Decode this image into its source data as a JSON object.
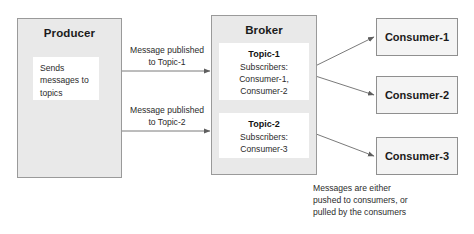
{
  "diagram": {
    "producer": {
      "title": "Producer",
      "note_lines": [
        "Sends",
        "messages to",
        "topics"
      ]
    },
    "broker": {
      "title": "Broker",
      "topics": [
        {
          "name": "Topic-1",
          "subscribers_label": "Subscribers:",
          "subscribers": [
            "Consumer-1,",
            "Consumer-2"
          ]
        },
        {
          "name": "Topic-2",
          "subscribers_label": "Subscribers:",
          "subscribers": [
            "Consumer-3"
          ]
        }
      ]
    },
    "consumers": [
      {
        "label": "Consumer-1"
      },
      {
        "label": "Consumer-2"
      },
      {
        "label": "Consumer-3"
      }
    ],
    "edge_labels": [
      {
        "line1": "Message published",
        "line2": "to Topic-1"
      },
      {
        "line1": "Message published",
        "line2": "to Topic-2"
      }
    ],
    "caption": {
      "line1": "Messages are either",
      "line2": "pushed to consumers, or",
      "line3": "pulled by the consumers"
    },
    "colors": {
      "container_fill": "#e9e9e9",
      "container_border": "#9a9a9a",
      "card_fill": "#ffffff",
      "consumer_fill": "#f4f4f4",
      "consumer_border": "#8f8f8f",
      "arrow": "#6b6b6b",
      "text": "#1b1b1b",
      "background": "#ffffff"
    }
  }
}
